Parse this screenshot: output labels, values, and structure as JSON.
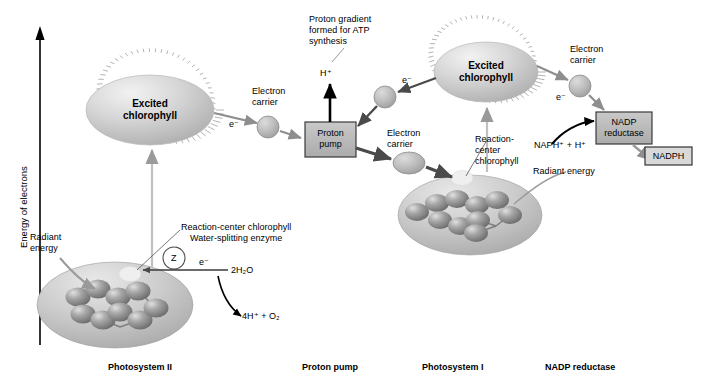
{
  "figure": {
    "axis": {
      "label": "Energy of electrons",
      "direction": "up"
    },
    "background_color": "#ffffff",
    "colors": {
      "box_fill": "#b3b3b3",
      "box_stroke": "#333333",
      "arrow_gray": "#8a8a8a",
      "arrow_dark": "#4d4d4d",
      "arrow_black": "#000000",
      "ellipse_fill": "#c8c8c8",
      "sphere_fill": "#9a9a9a",
      "halo": "#b0b0b0",
      "text": "#000000"
    }
  },
  "stages": [
    {
      "id": "psii",
      "label": "Photosystem II",
      "x": 108,
      "y": 367
    },
    {
      "id": "proton_pump",
      "label": "Proton pump",
      "x": 302,
      "y": 367
    },
    {
      "id": "psi",
      "label": "Photosystem I",
      "x": 422,
      "y": 367
    },
    {
      "id": "nadp_reductase",
      "label": "NADP reductase",
      "x": 545,
      "y": 367
    }
  ],
  "chlorophyll": {
    "excited_psii": {
      "line1": "Excited",
      "line2": "chlorophyll"
    },
    "excited_psi": {
      "line1": "Excited",
      "line2": "chlorophyll"
    }
  },
  "annotations": {
    "proton_gradient": "Proton gradient\nformed for ATP\nsynthesis",
    "h_plus": "H⁺",
    "electron_carrier_1": "Electron\ncarrier",
    "electron_carrier_2": "Electron\ncarrier",
    "electron_carrier_3": "Electron\ncarrier",
    "e_minus_1": "e⁻",
    "e_minus_2": "e⁻",
    "e_minus_3": "e⁻",
    "e_minus_4": "e⁻",
    "reaction_center_psii": "Reaction-center chlorophyll",
    "reaction_center_psi": "Reaction-\ncenter\nchlorophyll",
    "water_splitting_enzyme": "Water-splitting enzyme",
    "enzyme_symbol": "Z",
    "radiant_energy_psii": "Radiant\nenergy",
    "radiant_energy_psi": "Radiant energy",
    "water_input": "2H₂O",
    "water_products": "4H⁺ + O₂",
    "nadp_input": "NAPH⁺ + H⁺"
  },
  "boxes": {
    "proton_pump": {
      "line1": "Proton",
      "line2": "pump"
    },
    "nadp_reductase": {
      "line1": "NADP",
      "line2": "reductase"
    },
    "nadph": {
      "line1": "NADPH"
    }
  }
}
